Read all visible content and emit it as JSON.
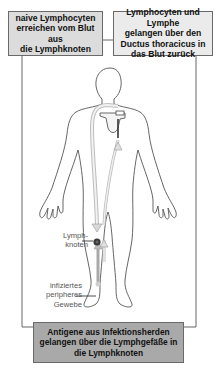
{
  "diagram": {
    "title_boxes": {
      "top_left": {
        "lines": [
          "naive Lymphocyten",
          "erreichen vom Blut aus",
          "die Lymphknoten"
        ]
      },
      "top_right": {
        "lines": [
          "Lymphocyten und Lymphe",
          "gelangen über den",
          "Ductus thoracicus in",
          "das Blut zurück"
        ]
      },
      "bottom": {
        "lines": [
          "Antigene aus Infektionsherden",
          "gelangen über die Lymphgefäße in",
          "die Lymphknoten"
        ]
      }
    },
    "labels": {
      "lymph_node": {
        "lines": [
          "Lymph-",
          "knoten"
        ]
      },
      "infected_tissue": {
        "lines": [
          "infiziertes",
          "peripheres",
          "Gewebe"
        ]
      }
    },
    "colors": {
      "top_left_box": "#dcdcdc",
      "top_right_box": "#ebebeb",
      "bottom_box": "#a9a9a9",
      "outline": "#555555",
      "vessel": "#c8c8c8",
      "lymph_node": "#333333"
    }
  }
}
